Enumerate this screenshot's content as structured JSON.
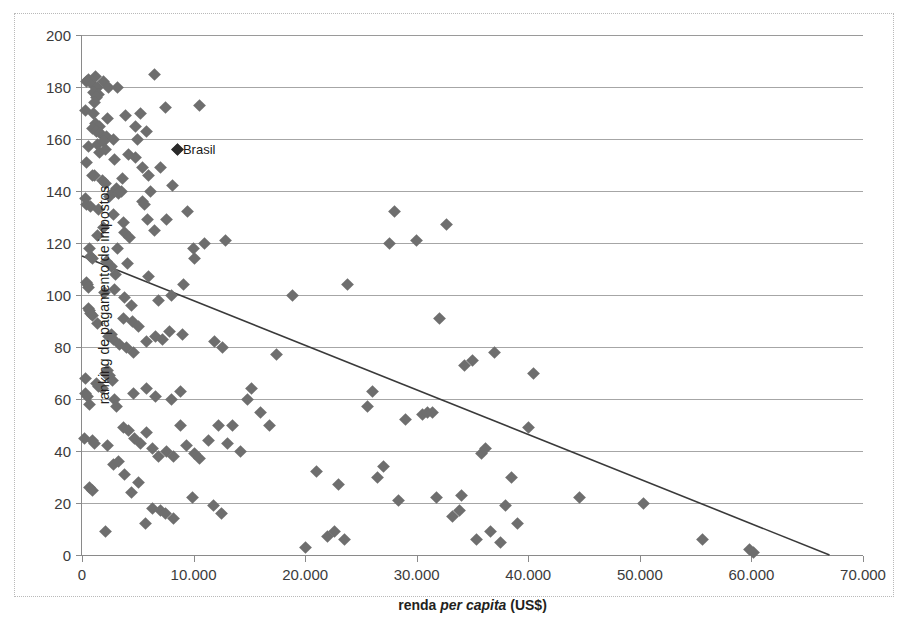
{
  "chart_title": "",
  "axes": {
    "x_title_prefix": "renda ",
    "x_title_italic": "per capita",
    "x_title_suffix": " (US$)",
    "y_title": "ranking de pagamento de impostos"
  },
  "chart_data": {
    "type": "scatter",
    "title": "",
    "xlabel": "renda per capita (US$)",
    "ylabel": "ranking de pagamento de impostos",
    "xlim": [
      0,
      70000
    ],
    "ylim": [
      0,
      200
    ],
    "grid": true,
    "legend": false,
    "xticks": [
      0,
      10000,
      20000,
      30000,
      40000,
      50000,
      60000,
      70000
    ],
    "xtick_labels": [
      "0",
      "10.000",
      "20.000",
      "30.000",
      "40.000",
      "50.000",
      "60.000",
      "70.000"
    ],
    "yticks": [
      0,
      20,
      40,
      60,
      80,
      100,
      120,
      140,
      160,
      180,
      200
    ],
    "ytick_labels": [
      "0",
      "20",
      "40",
      "60",
      "80",
      "100",
      "120",
      "140",
      "160",
      "180",
      "200"
    ],
    "marker_color": "#6e6e6e",
    "marker_shape": "diamond",
    "annotations": [
      {
        "label": "Brasil",
        "x": 8600,
        "y": 156,
        "color": "#2a2a2a"
      }
    ],
    "trendline": {
      "type": "linear",
      "x0": 0,
      "y0": 115,
      "x1": 67000,
      "y1": 0,
      "color": "#3a3a3a"
    },
    "points": [
      [
        400,
        182
      ],
      [
        600,
        183
      ],
      [
        900,
        181
      ],
      [
        1200,
        184
      ],
      [
        1400,
        180
      ],
      [
        1000,
        178
      ],
      [
        1500,
        177
      ],
      [
        1300,
        176
      ],
      [
        1100,
        174
      ],
      [
        1900,
        182
      ],
      [
        2400,
        180
      ],
      [
        3200,
        180
      ],
      [
        6500,
        185
      ],
      [
        300,
        171
      ],
      [
        1000,
        170
      ],
      [
        1200,
        166
      ],
      [
        1600,
        165
      ],
      [
        2300,
        168
      ],
      [
        3900,
        169
      ],
      [
        5200,
        170
      ],
      [
        7500,
        172
      ],
      [
        10500,
        173
      ],
      [
        900,
        164
      ],
      [
        1300,
        163
      ],
      [
        1700,
        162
      ],
      [
        2200,
        161
      ],
      [
        2800,
        160
      ],
      [
        4800,
        165
      ],
      [
        5800,
        163
      ],
      [
        5000,
        160
      ],
      [
        600,
        157
      ],
      [
        1400,
        158
      ],
      [
        1900,
        159
      ],
      [
        1600,
        155
      ],
      [
        2100,
        156
      ],
      [
        8600,
        156
      ],
      [
        400,
        151
      ],
      [
        900,
        146
      ],
      [
        1100,
        146
      ],
      [
        1800,
        144
      ],
      [
        2900,
        152
      ],
      [
        4200,
        154
      ],
      [
        4800,
        153
      ],
      [
        3600,
        145
      ],
      [
        5400,
        149
      ],
      [
        6000,
        146
      ],
      [
        7000,
        149
      ],
      [
        300,
        137
      ],
      [
        400,
        135
      ],
      [
        800,
        134
      ],
      [
        1500,
        133
      ],
      [
        2100,
        143
      ],
      [
        2500,
        138
      ],
      [
        2900,
        140
      ],
      [
        3100,
        141
      ],
      [
        3300,
        139
      ],
      [
        3500,
        140
      ],
      [
        6100,
        140
      ],
      [
        8100,
        142
      ],
      [
        2800,
        131
      ],
      [
        3700,
        128
      ],
      [
        3800,
        124
      ],
      [
        4300,
        122
      ],
      [
        1400,
        123
      ],
      [
        1900,
        126
      ],
      [
        5400,
        136
      ],
      [
        5600,
        135
      ],
      [
        5900,
        129
      ],
      [
        6500,
        125
      ],
      [
        7600,
        129
      ],
      [
        9500,
        132
      ],
      [
        700,
        118
      ],
      [
        800,
        115
      ],
      [
        900,
        114
      ],
      [
        3200,
        118
      ],
      [
        4100,
        112
      ],
      [
        2600,
        111
      ],
      [
        2200,
        113
      ],
      [
        3000,
        108
      ],
      [
        11000,
        120
      ],
      [
        10000,
        118
      ],
      [
        10100,
        114
      ],
      [
        12900,
        121
      ],
      [
        400,
        105
      ],
      [
        500,
        104
      ],
      [
        600,
        103
      ],
      [
        2000,
        101
      ],
      [
        2900,
        102
      ],
      [
        3800,
        99
      ],
      [
        4400,
        96
      ],
      [
        6000,
        107
      ],
      [
        8000,
        100
      ],
      [
        9100,
        104
      ],
      [
        6900,
        98
      ],
      [
        600,
        95
      ],
      [
        700,
        94
      ],
      [
        800,
        93
      ],
      [
        900,
        92
      ],
      [
        1400,
        89
      ],
      [
        3700,
        91
      ],
      [
        4500,
        90
      ],
      [
        5100,
        88
      ],
      [
        7800,
        86
      ],
      [
        9000,
        85
      ],
      [
        2400,
        84
      ],
      [
        2600,
        85
      ],
      [
        2800,
        83
      ],
      [
        3400,
        81
      ],
      [
        4000,
        80
      ],
      [
        4600,
        78
      ],
      [
        5800,
        82
      ],
      [
        6600,
        84
      ],
      [
        7200,
        83
      ],
      [
        11900,
        82
      ],
      [
        12600,
        80
      ],
      [
        300,
        68
      ],
      [
        1300,
        66
      ],
      [
        1500,
        65
      ],
      [
        1800,
        64
      ],
      [
        2100,
        70
      ],
      [
        2300,
        71
      ],
      [
        2500,
        69
      ],
      [
        2700,
        67
      ],
      [
        300,
        62
      ],
      [
        500,
        61
      ],
      [
        700,
        58
      ],
      [
        2900,
        60
      ],
      [
        3100,
        57
      ],
      [
        4600,
        62
      ],
      [
        5800,
        64
      ],
      [
        6600,
        61
      ],
      [
        8000,
        60
      ],
      [
        8800,
        63
      ],
      [
        200,
        45
      ],
      [
        900,
        44
      ],
      [
        1100,
        43
      ],
      [
        2300,
        42
      ],
      [
        3700,
        49
      ],
      [
        4200,
        48
      ],
      [
        4700,
        45
      ],
      [
        5200,
        43
      ],
      [
        5800,
        47
      ],
      [
        6300,
        41
      ],
      [
        6900,
        38
      ],
      [
        7600,
        40
      ],
      [
        8200,
        38
      ],
      [
        8800,
        50
      ],
      [
        9400,
        42
      ],
      [
        10100,
        39
      ],
      [
        10500,
        37
      ],
      [
        11300,
        44
      ],
      [
        12200,
        50
      ],
      [
        13000,
        43
      ],
      [
        14200,
        40
      ],
      [
        700,
        26
      ],
      [
        900,
        25
      ],
      [
        2100,
        9
      ],
      [
        2800,
        35
      ],
      [
        3300,
        36
      ],
      [
        3800,
        31
      ],
      [
        4400,
        24
      ],
      [
        5100,
        28
      ],
      [
        5700,
        12
      ],
      [
        6300,
        18
      ],
      [
        7000,
        17
      ],
      [
        7500,
        16
      ],
      [
        8200,
        14
      ],
      [
        9900,
        22
      ],
      [
        11800,
        19
      ],
      [
        12500,
        16
      ],
      [
        13500,
        50
      ],
      [
        14800,
        60
      ],
      [
        15200,
        64
      ],
      [
        16000,
        55
      ],
      [
        16800,
        50
      ],
      [
        17400,
        77
      ],
      [
        18900,
        100
      ],
      [
        20000,
        3
      ],
      [
        21000,
        32
      ],
      [
        22000,
        7
      ],
      [
        22600,
        9
      ],
      [
        23000,
        27
      ],
      [
        23500,
        6
      ],
      [
        23800,
        104
      ],
      [
        25600,
        57
      ],
      [
        26000,
        63
      ],
      [
        26500,
        30
      ],
      [
        27000,
        34
      ],
      [
        27600,
        120
      ],
      [
        28000,
        132
      ],
      [
        28400,
        21
      ],
      [
        29000,
        52
      ],
      [
        30000,
        121
      ],
      [
        30500,
        54
      ],
      [
        31000,
        55
      ],
      [
        31400,
        55
      ],
      [
        31800,
        22
      ],
      [
        32000,
        91
      ],
      [
        32700,
        127
      ],
      [
        33200,
        15
      ],
      [
        33800,
        17
      ],
      [
        34000,
        23
      ],
      [
        34300,
        73
      ],
      [
        35000,
        75
      ],
      [
        35400,
        6
      ],
      [
        35800,
        39
      ],
      [
        36200,
        41
      ],
      [
        36600,
        9
      ],
      [
        37000,
        78
      ],
      [
        37500,
        5
      ],
      [
        38000,
        19
      ],
      [
        38500,
        30
      ],
      [
        39000,
        12
      ],
      [
        40000,
        49
      ],
      [
        40500,
        70
      ],
      [
        44600,
        22
      ],
      [
        50300,
        20
      ],
      [
        55600,
        6
      ],
      [
        59800,
        2
      ],
      [
        60200,
        1
      ]
    ]
  }
}
